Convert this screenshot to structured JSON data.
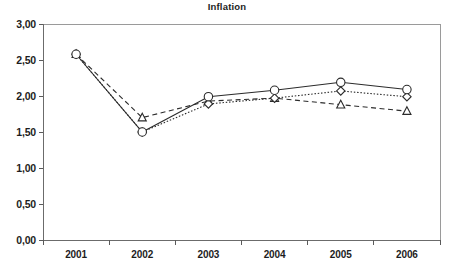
{
  "chart_data": {
    "type": "line",
    "title": "Inflation",
    "xlabel": "",
    "ylabel": "",
    "categories": [
      "2001",
      "2002",
      "2003",
      "2004",
      "2005",
      "2006"
    ],
    "ylim": [
      0.0,
      3.0
    ],
    "ytick_values": [
      0.0,
      0.5,
      1.0,
      1.5,
      2.0,
      2.5,
      3.0
    ],
    "ytick_labels": [
      "0,00",
      "0,50",
      "1,00",
      "1,50",
      "2,00",
      "2,50",
      "3,00"
    ],
    "grid": false,
    "legend": "none",
    "decimal_separator": ",",
    "series": [
      {
        "name": "series-1",
        "marker": "circle",
        "line_style": "solid",
        "color": "#2b2b2b",
        "values": [
          2.58,
          1.5,
          1.99,
          2.08,
          2.19,
          2.09
        ]
      },
      {
        "name": "series-2",
        "marker": "diamond",
        "line_style": "dotted",
        "color": "#2b2b2b",
        "values": [
          2.58,
          1.5,
          1.89,
          1.97,
          2.07,
          1.99
        ]
      },
      {
        "name": "series-3",
        "marker": "triangle",
        "line_style": "dashed",
        "color": "#2b2b2b",
        "values": [
          2.58,
          1.7,
          1.93,
          1.97,
          1.88,
          1.79
        ]
      }
    ]
  },
  "axes": {
    "plot_left": 43,
    "plot_right": 440,
    "plot_top": 24,
    "plot_bottom": 240
  }
}
